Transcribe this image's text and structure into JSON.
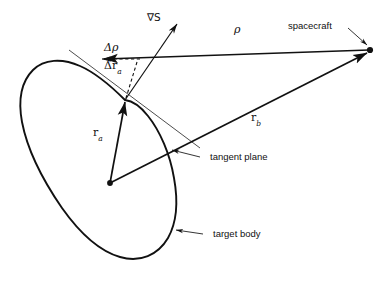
{
  "figure": {
    "kind": "vector-geometry-diagram",
    "background_color": "#ffffff",
    "stroke_color": "#111111",
    "width": 382,
    "height": 287,
    "labels": {
      "grad_s": "∇S",
      "delta_rho": "Δρ",
      "delta_r_a_symbol": "Δr",
      "delta_r_a_subscript": "a",
      "rho": "ρ",
      "r_a_symbol": "r",
      "r_a_subscript": "a",
      "r_b_symbol": "r",
      "r_b_subscript": "b",
      "spacecraft": "spacecraft",
      "tangent_plane": "tangent plane",
      "target_body": "target body"
    },
    "points": {
      "spacecraft": [
        370,
        50
      ],
      "surface_contact": [
        125,
        100
      ],
      "body_center": [
        110,
        183
      ],
      "grad_s_tip": [
        178,
        22
      ],
      "delta_rho_arrow_tip": [
        100,
        59
      ],
      "delta_rho_arrow_tail": [
        143,
        59
      ]
    }
  }
}
